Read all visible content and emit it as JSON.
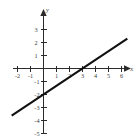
{
  "figure": {
    "corner_note": "",
    "background_color": "#ffffff",
    "line_color": "#111111",
    "axis_color": "#2b2b2b",
    "label_color": "#3a3a3a"
  },
  "chart_data": {
    "type": "line",
    "title": "",
    "xlabel": "x",
    "ylabel": "y",
    "xlim": [
      -2.6,
      6.9
    ],
    "ylim": [
      -5.6,
      3.7
    ],
    "grid": false,
    "legend": null,
    "x_ticks": [
      -2,
      -1,
      1,
      2,
      3,
      4,
      5,
      6
    ],
    "x_tick_labels": [
      "-2",
      "-1",
      "1",
      "2",
      "3",
      "4",
      "5",
      "6"
    ],
    "y_ticks": [
      3,
      2,
      1,
      -1,
      -2,
      -3,
      -4,
      -5
    ],
    "y_tick_labels": [
      "3",
      "2",
      "1",
      "-1",
      "-2",
      "-3",
      "-4",
      "-5"
    ],
    "series": [
      {
        "name": "y = (2/3)x - 2",
        "slope": 0.6667,
        "intercept": -2,
        "x": [
          -2.45,
          6.45
        ],
        "y": [
          -3.63,
          2.3
        ],
        "x_intercept": 3,
        "y_intercept": -2
      }
    ]
  }
}
